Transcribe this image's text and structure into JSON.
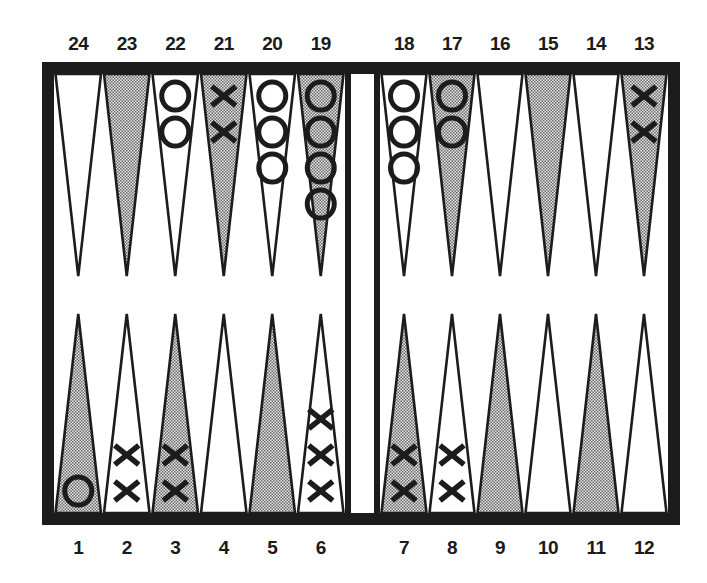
{
  "board": {
    "title": "Backgammon position",
    "colors": {
      "frame": "#1c1c1c",
      "background": "#ffffff",
      "shaded_point": "#bdbdbd",
      "checker_ink": "#1c1c1c"
    },
    "top_labels": [
      "24",
      "23",
      "22",
      "21",
      "20",
      "19",
      "18",
      "17",
      "16",
      "15",
      "14",
      "13"
    ],
    "bottom_labels": [
      "1",
      "2",
      "3",
      "4",
      "5",
      "6",
      "7",
      "8",
      "9",
      "10",
      "11",
      "12"
    ],
    "points": [
      {
        "number": 1,
        "shaded": true,
        "player": "O",
        "count": 1
      },
      {
        "number": 2,
        "shaded": false,
        "player": "X",
        "count": 2
      },
      {
        "number": 3,
        "shaded": true,
        "player": "X",
        "count": 2
      },
      {
        "number": 4,
        "shaded": false,
        "player": "",
        "count": 0
      },
      {
        "number": 5,
        "shaded": true,
        "player": "",
        "count": 0
      },
      {
        "number": 6,
        "shaded": false,
        "player": "X",
        "count": 3
      },
      {
        "number": 7,
        "shaded": true,
        "player": "X",
        "count": 2
      },
      {
        "number": 8,
        "shaded": false,
        "player": "X",
        "count": 2
      },
      {
        "number": 9,
        "shaded": true,
        "player": "",
        "count": 0
      },
      {
        "number": 10,
        "shaded": false,
        "player": "",
        "count": 0
      },
      {
        "number": 11,
        "shaded": true,
        "player": "",
        "count": 0
      },
      {
        "number": 12,
        "shaded": false,
        "player": "",
        "count": 0
      },
      {
        "number": 13,
        "shaded": true,
        "player": "X",
        "count": 2
      },
      {
        "number": 14,
        "shaded": false,
        "player": "",
        "count": 0
      },
      {
        "number": 15,
        "shaded": true,
        "player": "",
        "count": 0
      },
      {
        "number": 16,
        "shaded": false,
        "player": "",
        "count": 0
      },
      {
        "number": 17,
        "shaded": true,
        "player": "O",
        "count": 2
      },
      {
        "number": 18,
        "shaded": false,
        "player": "O",
        "count": 3
      },
      {
        "number": 19,
        "shaded": true,
        "player": "O",
        "count": 4
      },
      {
        "number": 20,
        "shaded": false,
        "player": "O",
        "count": 3
      },
      {
        "number": 21,
        "shaded": true,
        "player": "X",
        "count": 2
      },
      {
        "number": 22,
        "shaded": false,
        "player": "O",
        "count": 2
      },
      {
        "number": 23,
        "shaded": true,
        "player": "",
        "count": 0
      },
      {
        "number": 24,
        "shaded": false,
        "player": "",
        "count": 0
      }
    ],
    "bar": {
      "X": 0,
      "O": 0
    },
    "totals": {
      "X": 15,
      "O": 15
    }
  }
}
